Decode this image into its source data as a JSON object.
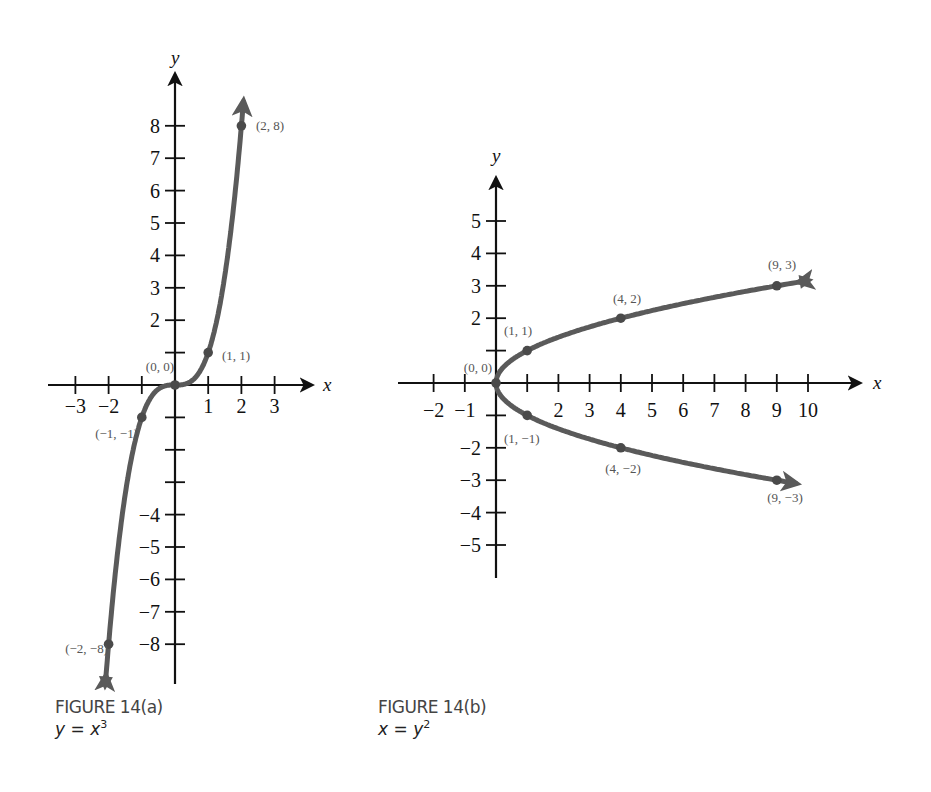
{
  "chart_data": [
    {
      "type": "line",
      "title": "FIGURE 14(a)",
      "equation": "y = x^3",
      "xlabel": "x",
      "ylabel": "y",
      "x_ticks": [
        -3,
        -2,
        -1,
        1,
        2,
        3
      ],
      "x_tick_labels": [
        "−3",
        "−2",
        "1",
        "2",
        "3"
      ],
      "y_ticks": [
        -8,
        -7,
        -6,
        -5,
        -4,
        -3,
        -2,
        -1,
        1,
        2,
        3,
        4,
        5,
        6,
        7,
        8
      ],
      "y_tick_labels": [
        "8",
        "7",
        "6",
        "5",
        "4",
        "3",
        "2",
        "−4",
        "−5",
        "−6",
        "−7",
        "−8"
      ],
      "xlim": [
        -3.8,
        4.1
      ],
      "ylim": [
        -9.1,
        9.1
      ],
      "grid": false,
      "series": [
        {
          "name": "y = x^3",
          "color": "#555555",
          "x": [
            -2,
            -1,
            0,
            1,
            2
          ],
          "y": [
            -8,
            -1,
            0,
            1,
            8
          ],
          "arrows_at_ends": true
        }
      ],
      "annotations": [
        {
          "text": "(2, 8)",
          "x": 2,
          "y": 8
        },
        {
          "text": "(1, 1)",
          "x": 1,
          "y": 1
        },
        {
          "text": "(0, 0)",
          "x": 0,
          "y": 0
        },
        {
          "text": "(−1, −1)",
          "x": -1,
          "y": -1
        },
        {
          "text": "(−2, −8)",
          "x": -2,
          "y": -8
        }
      ]
    },
    {
      "type": "line",
      "title": "FIGURE 14(b)",
      "equation": "x = y^2",
      "xlabel": "x",
      "ylabel": "y",
      "x_ticks": [
        -2,
        -1,
        1,
        2,
        3,
        4,
        5,
        6,
        7,
        8,
        9,
        10
      ],
      "x_tick_labels": [
        "−2",
        "−1",
        "2",
        "3",
        "4",
        "5",
        "6",
        "7",
        "8",
        "9",
        "10"
      ],
      "y_ticks": [
        -5,
        -4,
        -3,
        -2,
        -1,
        1,
        2,
        3,
        4,
        5
      ],
      "y_tick_labels": [
        "5",
        "4",
        "3",
        "2",
        "−2",
        "−3",
        "−4",
        "−5"
      ],
      "xlim": [
        -3.2,
        11.7
      ],
      "ylim": [
        -6,
        6.4
      ],
      "grid": false,
      "series": [
        {
          "name": "x = y^2",
          "color": "#555555",
          "x": [
            9,
            4,
            1,
            0,
            1,
            4,
            9
          ],
          "y": [
            3,
            2,
            1,
            0,
            -1,
            -2,
            -3
          ],
          "arrows_at_ends": true
        }
      ],
      "annotations": [
        {
          "text": "(9, 3)",
          "x": 9,
          "y": 3
        },
        {
          "text": "(4, 2)",
          "x": 4,
          "y": 2
        },
        {
          "text": "(1, 1)",
          "x": 1,
          "y": 1
        },
        {
          "text": "(0, 0)",
          "x": 0,
          "y": 0
        },
        {
          "text": "(1, −1)",
          "x": 1,
          "y": -1
        },
        {
          "text": "(4, −2)",
          "x": 4,
          "y": -2
        },
        {
          "text": "(9, −3)",
          "x": 9,
          "y": -3
        }
      ]
    }
  ],
  "figures": {
    "a": {
      "caption_title": "FIGURE 14(a)",
      "caption_lhs": "y",
      "caption_eq": " = ",
      "caption_rhs": "x",
      "caption_exp": "3",
      "axis_x": "x",
      "axis_y": "y"
    },
    "b": {
      "caption_title": "FIGURE 14(b)",
      "caption_lhs": "x",
      "caption_eq": " = ",
      "caption_rhs": "y",
      "caption_exp": "2",
      "axis_x": "x",
      "axis_y": "y"
    }
  },
  "colors": {
    "axis": "#111111",
    "curve": "#5a5a5a",
    "point": "#4a4a4a",
    "label": "#555555"
  }
}
